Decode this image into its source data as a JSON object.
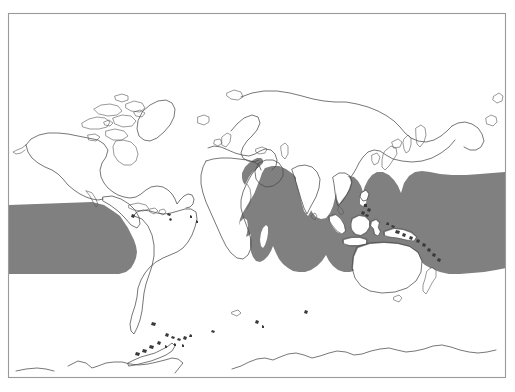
{
  "figure": {
    "kind": "world-distribution-map",
    "projection": "equirectangular",
    "background_color": "#ffffff",
    "frame": {
      "visible": true,
      "color": "#9a9a9a",
      "x": 8,
      "y": 13,
      "width": 498,
      "height": 365
    },
    "title": "",
    "caption": "",
    "credit": ""
  },
  "legend": {
    "visible": false,
    "entries": [
      {
        "label": "Distribution range",
        "color": "#808080",
        "swatch": "filled-gray"
      }
    ]
  },
  "range_layer": {
    "name": "shaded-distribution-range",
    "fill_color": "#808080",
    "description": "Tropical Indo-Pacific and eastern tropical Pacific shaded band",
    "regions": [
      {
        "name": "eastern-pacific-band",
        "note": "Band from left map edge east to the Pacific coast of Central and South America"
      },
      {
        "name": "indo-west-pacific-band",
        "note": "Red Sea, Indian Ocean, Southeast Asian archipelago, western and central Pacific to right map edge"
      }
    ]
  },
  "landmasses": [
    {
      "name": "north-america",
      "shaded": false
    },
    {
      "name": "central-america",
      "shaded": false
    },
    {
      "name": "south-america",
      "shaded": false
    },
    {
      "name": "greenland",
      "shaded": false
    },
    {
      "name": "iceland",
      "shaded": false
    },
    {
      "name": "europe",
      "shaded": false
    },
    {
      "name": "africa",
      "shaded": false
    },
    {
      "name": "madagascar",
      "shaded": false
    },
    {
      "name": "arabian-peninsula",
      "shaded": false
    },
    {
      "name": "asia",
      "shaded": false
    },
    {
      "name": "india",
      "shaded": false
    },
    {
      "name": "japan",
      "shaded": false
    },
    {
      "name": "southeast-asian-archipelago",
      "shaded": false
    },
    {
      "name": "new-guinea",
      "shaded": false
    },
    {
      "name": "australia",
      "shaded": false
    },
    {
      "name": "new-zealand",
      "shaded": false
    },
    {
      "name": "antarctica",
      "shaded": false
    }
  ],
  "oceans": [
    {
      "name": "pacific-ocean",
      "shaded_partial": true
    },
    {
      "name": "atlantic-ocean",
      "shaded_partial": false
    },
    {
      "name": "indian-ocean",
      "shaded_partial": true
    },
    {
      "name": "red-sea",
      "shaded_partial": true
    },
    {
      "name": "southern-ocean",
      "shaded_partial": false
    },
    {
      "name": "arctic-ocean",
      "shaded_partial": false
    }
  ],
  "chart_data": {
    "type": "map",
    "title": "",
    "xlabel": "",
    "ylabel": "",
    "grid": false,
    "legend_position": "none",
    "xlim": [
      -180,
      180
    ],
    "ylim": [
      -90,
      90
    ],
    "series": [
      {
        "name": "Distribution range",
        "color": "#808080",
        "polygons": [
          {
            "name": "eastern-pacific",
            "lat_range": [
              -22,
              26
            ],
            "lon_range": [
              -180,
              -77
            ]
          },
          {
            "name": "indo-west-pacific",
            "lat_range": [
              -32,
              32
            ],
            "lon_range": [
              32,
              180
            ]
          }
        ]
      }
    ]
  }
}
